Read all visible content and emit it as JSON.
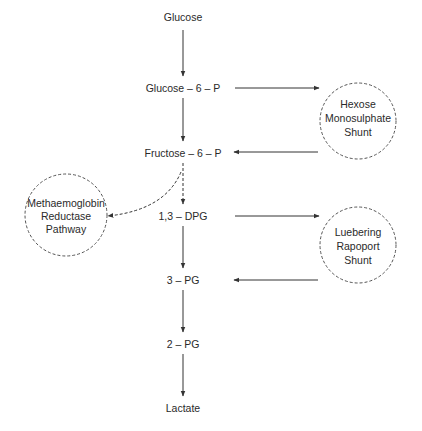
{
  "diagram": {
    "title": "",
    "main_pathway": [
      {
        "id": "glucose",
        "label": "Glucose"
      },
      {
        "id": "g6p",
        "label": "Glucose – 6 – P"
      },
      {
        "id": "f6p",
        "label": "Fructose – 6 – P"
      },
      {
        "id": "dpg13",
        "label": "1,3 – DPG"
      },
      {
        "id": "pg3",
        "label": "3 – PG"
      },
      {
        "id": "pg2",
        "label": "2 – PG"
      },
      {
        "id": "lactate",
        "label": "Lactate"
      }
    ],
    "side_pathways": {
      "hexose": {
        "lines": [
          "Hexose",
          "Monosulphate",
          "Shunt"
        ]
      },
      "luebering": {
        "lines": [
          "Luebering",
          "Rapoport",
          "Shunt"
        ]
      },
      "methaemoglobin": {
        "lines": [
          "Methaemoglobin",
          "Reductase",
          "Pathway"
        ]
      }
    },
    "edges": [
      {
        "from": "Glucose",
        "to": "Glucose – 6 – P",
        "style": "solid"
      },
      {
        "from": "Glucose – 6 – P",
        "to": "Fructose – 6 – P",
        "style": "solid"
      },
      {
        "from": "Fructose – 6 – P",
        "to": "1,3 – DPG",
        "style": "dashed"
      },
      {
        "from": "1,3 – DPG",
        "to": "3 – PG",
        "style": "solid"
      },
      {
        "from": "3 – PG",
        "to": "2 – PG",
        "style": "solid"
      },
      {
        "from": "2 – PG",
        "to": "Lactate",
        "style": "solid"
      },
      {
        "from": "Glucose – 6 – P",
        "to": "Hexose Monosulphate Shunt",
        "style": "solid"
      },
      {
        "from": "Hexose Monosulphate Shunt",
        "to": "Fructose – 6 – P",
        "style": "solid"
      },
      {
        "from": "1,3 – DPG",
        "to": "Luebering Rapoport Shunt",
        "style": "solid"
      },
      {
        "from": "Luebering Rapoport Shunt",
        "to": "3 – PG",
        "style": "solid"
      },
      {
        "from": "Fructose – 6 – P",
        "to": "Methaemoglobin Reductase Pathway",
        "style": "dashed"
      }
    ],
    "colors": {
      "line": "#333333",
      "text": "#2a2a2a",
      "background": "#ffffff"
    }
  }
}
